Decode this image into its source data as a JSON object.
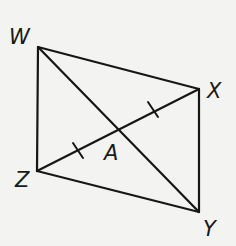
{
  "diagram": {
    "type": "quadrilateral-with-diagonals",
    "points": {
      "W": {
        "label": "W",
        "x": 38,
        "y": 47
      },
      "X": {
        "label": "X",
        "x": 199,
        "y": 89
      },
      "Y": {
        "label": "Y",
        "x": 199,
        "y": 212
      },
      "Z": {
        "label": "Z",
        "x": 37,
        "y": 171
      },
      "A": {
        "label": "A",
        "x": 119,
        "y": 128
      }
    },
    "sides": [
      "WX",
      "XY",
      "YZ",
      "ZW"
    ],
    "diagonals": [
      "WY",
      "XZ"
    ],
    "congruence_marks": {
      "segments": [
        "ZA",
        "AX"
      ],
      "marks_per_segment": 1
    },
    "colors": {
      "line": "#161616",
      "background": "#f3f3f1"
    }
  }
}
